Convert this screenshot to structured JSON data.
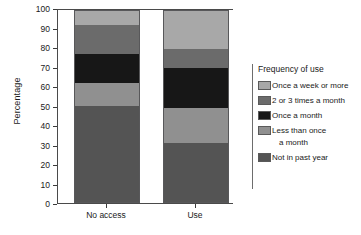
{
  "chart_data": {
    "type": "bar",
    "stacked": true,
    "title": "",
    "xlabel": "",
    "ylabel": "Percentage",
    "ylim": [
      0,
      100
    ],
    "yticks": [
      0,
      10,
      20,
      30,
      40,
      50,
      60,
      70,
      80,
      90,
      100
    ],
    "grid": false,
    "legend_position": "right",
    "legend_title": "Frequency of use",
    "categories": [
      "No access",
      "Use"
    ],
    "series": [
      {
        "name": "Once a week or more",
        "values": [
          8,
          20
        ],
        "color": "#a8a8a8"
      },
      {
        "name": "2 or 3 times a month",
        "values": [
          15,
          10
        ],
        "color": "#6b6b6b"
      },
      {
        "name": "Once a month",
        "values": [
          15,
          21
        ],
        "color": "#171717"
      },
      {
        "name": "Less than once a month",
        "values": [
          12,
          18
        ],
        "color": "#909090"
      },
      {
        "name": "Not in past year",
        "values": [
          50,
          31
        ],
        "color": "#545454"
      }
    ]
  },
  "axis": {
    "ylabel": "Percentage",
    "yticks": [
      "100",
      "90",
      "80",
      "70",
      "60",
      "50",
      "40",
      "30",
      "20",
      "10",
      "0"
    ],
    "xlabels": [
      "No access",
      "Use"
    ]
  },
  "legend": {
    "title": "Frequency of use",
    "items": [
      {
        "label": "Once a week or more",
        "label2": ""
      },
      {
        "label": "2 or 3 times a month",
        "label2": ""
      },
      {
        "label": "Once a month",
        "label2": ""
      },
      {
        "label": "Less than once",
        "label2": "a month"
      },
      {
        "label": "Not in past year",
        "label2": ""
      }
    ]
  }
}
